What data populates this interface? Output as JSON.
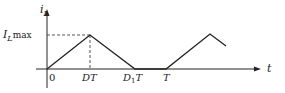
{
  "diagram": {
    "y_axis_label": "i",
    "y_axis_sub": "L",
    "x_axis_label": "t",
    "peak_label_main": "I",
    "peak_label_sub": "L",
    "peak_label_sub2": "max",
    "tick_labels": {
      "origin": "0",
      "dt": "DT",
      "d1t_main": "D",
      "d1t_sub": "1",
      "d1t_tail": "T",
      "t": "T"
    },
    "waveform_points": [
      {
        "t": "0",
        "i": 0
      },
      {
        "t": "DT",
        "i": "ILmax"
      },
      {
        "t": "D1T",
        "i": 0
      },
      {
        "t": "T",
        "i": 0
      },
      {
        "t": "T+DT",
        "i": "ILmax"
      },
      {
        "t": "partial fall",
        "i": "partial"
      }
    ],
    "colors": {
      "line": "#222222",
      "dash": "#444444"
    }
  }
}
